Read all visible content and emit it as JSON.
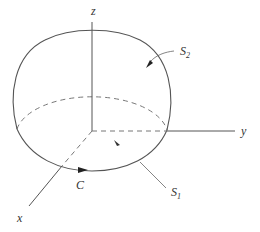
{
  "figure": {
    "type": "hemisphere-surface-diagram",
    "colors": {
      "line": "#555555",
      "dashed": "#777777",
      "text": "#333333",
      "background": "#ffffff"
    },
    "axes": {
      "z": {
        "label": "z"
      },
      "y": {
        "label": "y"
      },
      "x": {
        "label": "x"
      }
    },
    "labels": {
      "curve": "C",
      "s1_main": "S",
      "s1_sub": "1",
      "s2_main": "S",
      "s2_sub": "2"
    }
  }
}
